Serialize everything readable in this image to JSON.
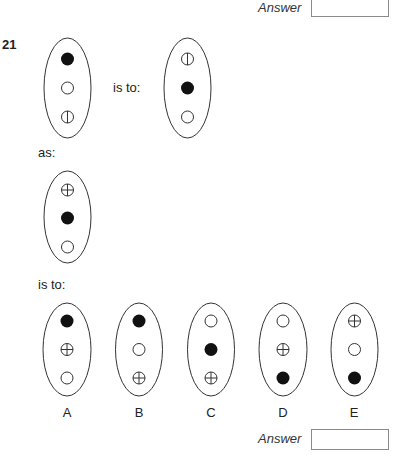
{
  "top_answer": {
    "label": "Answer",
    "value": ""
  },
  "question": {
    "number": "21",
    "is_to_1": "is to:",
    "as": "as:",
    "is_to_2": "is to:",
    "figures": {
      "source": [
        "filled",
        "empty",
        "vertical-line"
      ],
      "source_result": [
        "vertical-line",
        "filled",
        "empty"
      ],
      "target": [
        "cross",
        "filled",
        "empty"
      ]
    },
    "options": [
      {
        "label": "A",
        "circles": [
          "filled",
          "cross",
          "empty"
        ]
      },
      {
        "label": "B",
        "circles": [
          "filled",
          "empty",
          "cross"
        ]
      },
      {
        "label": "C",
        "circles": [
          "empty",
          "filled",
          "cross"
        ]
      },
      {
        "label": "D",
        "circles": [
          "empty",
          "cross",
          "filled"
        ]
      },
      {
        "label": "E",
        "circles": [
          "cross",
          "empty",
          "filled"
        ]
      }
    ]
  },
  "bottom_answer": {
    "label": "Answer",
    "value": ""
  },
  "colors": {
    "stroke": "#333333",
    "fill": "#111111",
    "box_border": "#8a8a8a"
  }
}
